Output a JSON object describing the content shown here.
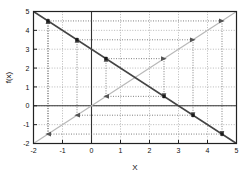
{
  "chart_data": {
    "type": "line",
    "title": "",
    "xlabel": "X",
    "ylabel": "f(x)",
    "xlim": [
      -2,
      5
    ],
    "ylim": [
      -2,
      5
    ],
    "xticks": [
      -2,
      -1,
      0,
      1,
      2,
      3,
      4,
      5
    ],
    "xticklabels": [
      "-2",
      "-1",
      "0",
      "1",
      "2",
      "3",
      "4",
      "5"
    ],
    "yticks": [
      -2,
      -1,
      0,
      1,
      2,
      3,
      4,
      5
    ],
    "yticklabels": [
      "-2",
      "-1",
      "0",
      "1",
      "2",
      "3",
      "4",
      "5"
    ],
    "grid": true,
    "grid_style": "dotted",
    "legend": null,
    "series": [
      {
        "name": "f(x) = 3 - x",
        "style": "solid",
        "color": "#444444",
        "x": [
          -2,
          5
        ],
        "values": [
          5,
          -2
        ]
      },
      {
        "name": "y = x",
        "style": "solid",
        "color": "#b8b8b8",
        "x": [
          -2,
          5
        ],
        "values": [
          -2,
          5
        ]
      }
    ],
    "cobweb": {
      "name": "cobweb orbit",
      "style": "dotted",
      "color": "#555555",
      "map": "f(x) = 3 - x",
      "start_x": -1.5,
      "points": [
        [
          -1.5,
          -1.5
        ],
        [
          -1.5,
          4.5
        ],
        [
          4.5,
          4.5
        ],
        [
          4.5,
          -1.5
        ],
        [
          -1.5,
          -1.5
        ],
        [
          -1.5,
          4.5
        ]
      ],
      "vertices_on_function": [
        [
          -1.5,
          4.5
        ],
        [
          -0.5,
          3.5
        ],
        [
          0.5,
          2.5
        ],
        [
          2.5,
          0.5
        ],
        [
          3.5,
          -0.5
        ],
        [
          4.5,
          -1.5
        ]
      ],
      "secondary_points": [
        [
          -0.5,
          -0.5
        ],
        [
          -0.5,
          3.5
        ],
        [
          3.5,
          3.5
        ],
        [
          3.5,
          -0.5
        ],
        [
          -0.5,
          -0.5
        ]
      ],
      "inner_points": [
        [
          0.5,
          0.5
        ],
        [
          0.5,
          2.5
        ],
        [
          2.5,
          2.5
        ],
        [
          2.5,
          0.5
        ],
        [
          0.5,
          0.5
        ]
      ],
      "arrow_directions": [
        "up",
        "right",
        "down",
        "left"
      ]
    },
    "colors": {
      "frame": "#222222",
      "axis": "#333333",
      "grid": "#9a9a9a",
      "function_line": "#444444",
      "identity_line": "#b8b8b8",
      "cobweb": "#555555",
      "background": "#ffffff"
    }
  }
}
